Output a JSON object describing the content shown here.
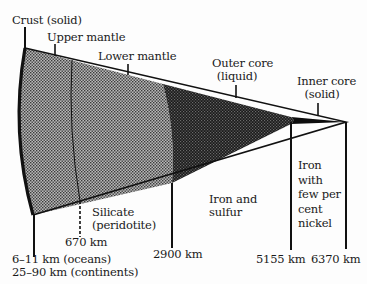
{
  "diagram": {
    "type": "earth-interior-cross-section-wedge",
    "top_labels": {
      "crust": "Crust (solid)",
      "upper_mantle": "Upper mantle",
      "lower_mantle": "Lower mantle",
      "outer_core_line1": "Outer core",
      "outer_core_line2": "(liquid)",
      "inner_core_line1": "Inner core",
      "inner_core_line2": "(solid)"
    },
    "composition_labels": {
      "silicate_line1": "Silicate",
      "silicate_line2": "(peridotite)",
      "iron_sulfur_line1": "Iron and",
      "iron_sulfur_line2": "sulfur",
      "iron_nickel_line1": "Iron",
      "iron_nickel_line2": "with",
      "iron_nickel_line3": "few per",
      "iron_nickel_line4": "cent",
      "iron_nickel_line5": "nickel"
    },
    "depth_labels": {
      "crust_oceans": "6–11 km (oceans)",
      "crust_continents": "25–90 km (continents)",
      "d670": "670 km",
      "d2900": "2900 km",
      "d5155": "5155 km",
      "d6370": "6370 km"
    },
    "colors": {
      "ink": "#111111",
      "mantle_fill": "#8a8a8a",
      "outer_core_fill": "#2c2c2c",
      "inner_core_fill": "#0d0d0d"
    }
  }
}
